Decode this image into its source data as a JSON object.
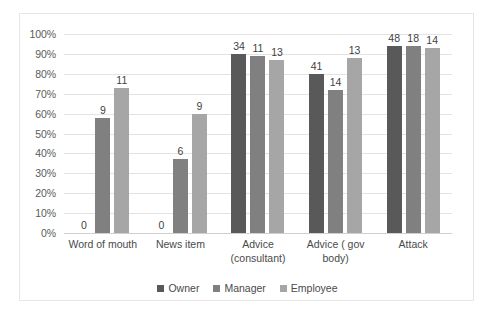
{
  "chart_data": {
    "type": "bar",
    "title": "",
    "subtitle": "",
    "xlabel": "",
    "ylabel": "",
    "ylim": [
      0,
      100
    ],
    "ytick_labels": [
      "100%",
      "90%",
      "80%",
      "70%",
      "60%",
      "50%",
      "40%",
      "30%",
      "20%",
      "10%",
      "0%"
    ],
    "ytick_values": [
      100,
      90,
      80,
      70,
      60,
      50,
      40,
      30,
      20,
      10,
      0
    ],
    "grid": true,
    "legend_position": "bottom",
    "categories": [
      "Word of mouth",
      "News item",
      "Advice (consultant)",
      "Advice ( gov body)",
      "Attack"
    ],
    "category_lines": [
      [
        "Word of mouth"
      ],
      [
        "News item"
      ],
      [
        "Advice",
        "(consultant)"
      ],
      [
        "Advice ( gov",
        "body)"
      ],
      [
        "Attack"
      ]
    ],
    "series": [
      {
        "name": "Owner",
        "color": "#595959",
        "values": [
          0,
          0,
          90,
          80,
          94
        ],
        "labels": [
          "0",
          "0",
          "34",
          "41",
          "48"
        ]
      },
      {
        "name": "Manager",
        "color": "#808080",
        "values": [
          58,
          37,
          89,
          72,
          94
        ],
        "labels": [
          "9",
          "6",
          "11",
          "14",
          "18"
        ]
      },
      {
        "name": "Employee",
        "color": "#a6a6a6",
        "values": [
          73,
          60,
          87,
          88,
          93
        ],
        "labels": [
          "11",
          "9",
          "13",
          "13",
          "14"
        ]
      }
    ]
  },
  "legend": {
    "items": [
      {
        "label": "Owner",
        "color": "#595959"
      },
      {
        "label": "Manager",
        "color": "#808080"
      },
      {
        "label": "Employee",
        "color": "#a6a6a6"
      }
    ]
  },
  "colors": {
    "owner": "#595959",
    "manager": "#808080",
    "employee": "#a6a6a6",
    "gridline": "#e3e3e3",
    "axis_text": "#5a5a5a",
    "frame_border": "#e6e6e6",
    "background": "#ffffff"
  }
}
